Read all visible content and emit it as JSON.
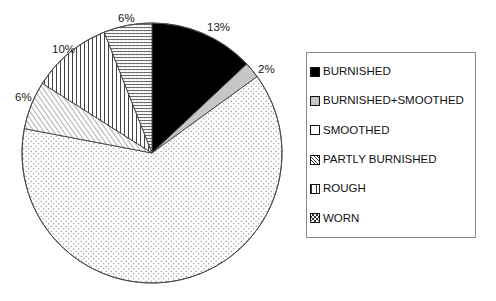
{
  "chart_data": {
    "type": "pie",
    "title": "",
    "categories": [
      "BURNISHED",
      "BURNISHED+SMOOTHED",
      "SMOOTHED",
      "PARTLY BURNISHED",
      "ROUGH",
      "WORN"
    ],
    "values": [
      13,
      2,
      63,
      6,
      10,
      6
    ],
    "value_labels": [
      "13%",
      "2%",
      "63%",
      "6%",
      "10%",
      "6%"
    ],
    "shown_labels": [
      "13%",
      "2%",
      "6%",
      "10%",
      "6%"
    ],
    "legend_position": "right",
    "grid": false,
    "start_angle_deg": 0,
    "direction": "clockwise",
    "slices": [
      {
        "name": "BURNISHED",
        "value": 13,
        "label": "13%",
        "label_shown": true,
        "pattern": "solid-black",
        "color": "#000000",
        "start_deg": 0,
        "end_deg": 46.8
      },
      {
        "name": "BURNISHED+SMOOTHED",
        "value": 2,
        "label": "2%",
        "label_shown": true,
        "pattern": "solid-gray",
        "color": "#c6c6c6",
        "start_deg": 46.8,
        "end_deg": 54.0
      },
      {
        "name": "SMOOTHED",
        "value": 63,
        "label": "63%",
        "label_shown": false,
        "pattern": "fine-dots",
        "color": "#ffffff",
        "start_deg": 54.0,
        "end_deg": 280.8
      },
      {
        "name": "PARTLY BURNISHED",
        "value": 6,
        "label": "6%",
        "label_shown": true,
        "pattern": "diagonal-hatch",
        "color": "#ffffff",
        "start_deg": 280.8,
        "end_deg": 302.4
      },
      {
        "name": "ROUGH",
        "value": 10,
        "label": "10%",
        "label_shown": true,
        "pattern": "vertical-lines",
        "color": "#ffffff",
        "start_deg": 302.4,
        "end_deg": 338.4
      },
      {
        "name": "WORN",
        "value": 6,
        "label": "6%",
        "label_shown": true,
        "pattern": "horizontal-hatch",
        "color": "#ffffff",
        "start_deg": 338.4,
        "end_deg": 360.0
      }
    ]
  },
  "labels": {
    "burnished_pct": "13%",
    "burnished_smoothed_pct": "2%",
    "worn_pct": "6%",
    "rough_pct": "10%",
    "partly_burnished_pct": "6%"
  },
  "legend": {
    "items": [
      {
        "label": "BURNISHED",
        "swatch": "solid-black"
      },
      {
        "label": "BURNISHED+SMOOTHED",
        "swatch": "solid-gray"
      },
      {
        "label": "SMOOTHED",
        "swatch": "fine-dots"
      },
      {
        "label": "PARTLY BURNISHED",
        "swatch": "diagonal-hatch"
      },
      {
        "label": "ROUGH",
        "swatch": "vertical-lines"
      },
      {
        "label": "WORN",
        "swatch": "cross-hatch"
      }
    ]
  },
  "colors": {
    "outline": "#4d4d4d",
    "legend_border": "#8a8a8a",
    "text": "#111111",
    "slice_black": "#000000",
    "slice_gray": "#c6c6c6",
    "background": "#ffffff"
  }
}
